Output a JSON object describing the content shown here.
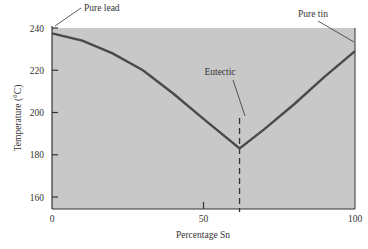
{
  "chart_data": {
    "type": "line",
    "title": "",
    "xlabel": "Percentage Sn",
    "ylabel": "Temperature (°C)",
    "xlim": [
      0,
      100
    ],
    "ylim": [
      155,
      240
    ],
    "x_ticks": [
      0,
      50,
      100
    ],
    "x_tick_labels": [
      "0",
      "50",
      "100"
    ],
    "y_ticks": [
      160,
      180,
      200,
      220,
      240
    ],
    "y_tick_labels": [
      "160",
      "180",
      "200",
      "220",
      "240"
    ],
    "grid": false,
    "plot_background": "#c8c8c8",
    "line_color": "#4a4a4a",
    "series": [
      {
        "name": "Liquidus curve (lead-tin)",
        "x": [
          0,
          10,
          20,
          30,
          40,
          50,
          61.9,
          70,
          80,
          90,
          100
        ],
        "y": [
          237.5,
          234,
          228,
          220,
          209,
          197,
          183,
          192,
          204,
          217,
          229
        ]
      }
    ],
    "reference_lines": [
      {
        "type": "vertical",
        "x": 61.9,
        "style": "dashed",
        "label": "Eutectic"
      }
    ],
    "annotations": [
      {
        "text": "Pure lead",
        "x": 0,
        "y": 240
      },
      {
        "text": "Eutectic",
        "x": 61.9,
        "y": 183
      },
      {
        "text": "Pure tin",
        "x": 100,
        "y": 232
      }
    ]
  }
}
